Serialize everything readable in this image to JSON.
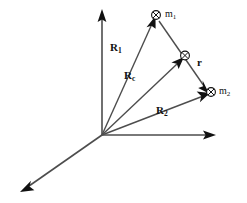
{
  "figure": {
    "background_color": "#ffffff",
    "line_color": "#4d4d4d",
    "arrow_color": "#111111",
    "label_color": "#111111",
    "origin": {
      "x": 102,
      "y": 135
    }
  },
  "axes": [
    {
      "name": "vertical-axis",
      "from": {
        "x": 102,
        "y": 135
      },
      "to": {
        "x": 102,
        "y": 12
      },
      "arrowhead": true,
      "label": ""
    },
    {
      "name": "horizontal-axis",
      "from": {
        "x": 102,
        "y": 135
      },
      "to": {
        "x": 214,
        "y": 135
      },
      "arrowhead": true,
      "label": ""
    },
    {
      "name": "diagonal-axis",
      "from": {
        "x": 102,
        "y": 135
      },
      "to": {
        "x": 22,
        "y": 191
      },
      "arrowhead": true,
      "label": ""
    }
  ],
  "vectors": [
    {
      "id": "R1",
      "name": "vector-R1",
      "label_main": "R",
      "label_sub": "1",
      "from": {
        "x": 102,
        "y": 135
      },
      "to": {
        "x": 153,
        "y": 21
      },
      "label_pos": {
        "x": 112,
        "y": 48
      },
      "arrowhead": true
    },
    {
      "id": "Rc",
      "name": "vector-Rc",
      "label_main": "R",
      "label_sub": "c",
      "from": {
        "x": 102,
        "y": 135
      },
      "to": {
        "x": 181,
        "y": 60
      },
      "label_pos": {
        "x": 126,
        "y": 76
      },
      "arrowhead": true
    },
    {
      "id": "R2",
      "name": "vector-R2",
      "label_main": "R",
      "label_sub": "2",
      "from": {
        "x": 102,
        "y": 135
      },
      "to": {
        "x": 206,
        "y": 95
      },
      "label_pos": {
        "x": 158,
        "y": 111
      },
      "arrowhead": true
    },
    {
      "id": "r",
      "name": "vector-r",
      "label_main": "r",
      "label_sub": "",
      "from": {
        "x": 157,
        "y": 20
      },
      "to": {
        "x": 207,
        "y": 93
      },
      "label_pos": {
        "x": 197,
        "y": 62
      },
      "arrowhead": true
    }
  ],
  "points": [
    {
      "id": "m1",
      "name": "mass-point-m1",
      "marker": "circled-cross-marker",
      "x": 156,
      "y": 16,
      "label_main": "m",
      "label_sub": "1",
      "label_pos": {
        "x": 166,
        "y": 11
      }
    },
    {
      "id": "com",
      "name": "center-of-mass-point",
      "marker": "circled-cross-marker",
      "x": 184,
      "y": 57,
      "label_main": "",
      "label_sub": "",
      "label_pos": {
        "x": 0,
        "y": 0
      }
    },
    {
      "id": "m2",
      "name": "mass-point-m2",
      "marker": "circled-cross-marker",
      "x": 210,
      "y": 92,
      "label_main": "m",
      "label_sub": "2",
      "label_pos": {
        "x": 219,
        "y": 88
      }
    }
  ]
}
